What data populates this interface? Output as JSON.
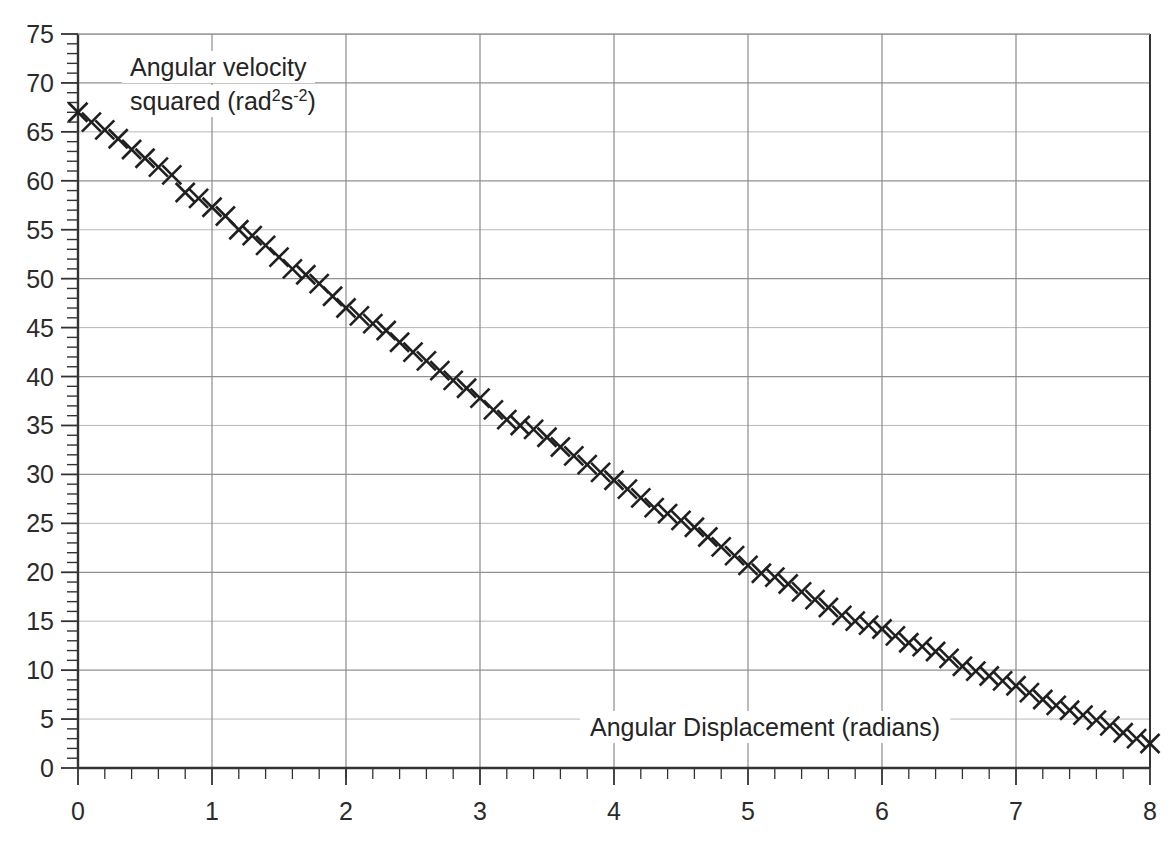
{
  "chart_data": {
    "type": "scatter",
    "title": "",
    "xlabel": "Angular Displacement (radians)",
    "ylabel_line1": "Angular velocity",
    "ylabel_line2_prefix": "squared (rad",
    "ylabel_sup1": "2",
    "ylabel_mid": "s",
    "ylabel_sup2": "-2",
    "ylabel_suffix": ")",
    "ylabel_plain": "Angular velocity squared (rad2s-2)",
    "xlim": [
      0,
      8
    ],
    "ylim": [
      0,
      75
    ],
    "x_major_step": 1,
    "x_minor_step": 0.2,
    "y_major_step": 5,
    "y_minor_step": 1,
    "grid": true,
    "legend": "none",
    "marker": "x-cross",
    "marker_color": "#1f1f1f",
    "grid_color": "#8c8c8c",
    "axis_color": "#333333",
    "xticks": [
      "0",
      "1",
      "2",
      "3",
      "4",
      "5",
      "6",
      "7",
      "8"
    ],
    "xtick_values": [
      0,
      1,
      2,
      3,
      4,
      5,
      6,
      7,
      8
    ],
    "yticks": [
      "0",
      "5",
      "10",
      "15",
      "20",
      "25",
      "30",
      "35",
      "40",
      "45",
      "50",
      "55",
      "60",
      "65",
      "70",
      "75"
    ],
    "ytick_values": [
      0,
      5,
      10,
      15,
      20,
      25,
      30,
      35,
      40,
      45,
      50,
      55,
      60,
      65,
      70,
      75
    ],
    "fit_line": {
      "intercept": 67.0,
      "slope": -8.06
    },
    "x": [
      0.0,
      0.1,
      0.2,
      0.3,
      0.4,
      0.5,
      0.6,
      0.7,
      0.8,
      0.9,
      1.0,
      1.1,
      1.2,
      1.3,
      1.4,
      1.5,
      1.6,
      1.7,
      1.8,
      1.9,
      2.0,
      2.1,
      2.2,
      2.3,
      2.4,
      2.5,
      2.6,
      2.7,
      2.8,
      2.9,
      3.0,
      3.1,
      3.2,
      3.3,
      3.4,
      3.5,
      3.6,
      3.7,
      3.8,
      3.9,
      4.0,
      4.1,
      4.2,
      4.3,
      4.4,
      4.5,
      4.6,
      4.7,
      4.8,
      4.9,
      5.0,
      5.1,
      5.2,
      5.3,
      5.4,
      5.5,
      5.6,
      5.7,
      5.8,
      5.9,
      6.0,
      6.1,
      6.2,
      6.3,
      6.4,
      6.5,
      6.6,
      6.7,
      6.8,
      6.9,
      7.0,
      7.1,
      7.2,
      7.3,
      7.4,
      7.5,
      7.6,
      7.7,
      7.8,
      7.9,
      8.0
    ],
    "y": [
      67.0,
      66.0,
      65.2,
      64.3,
      63.2,
      62.3,
      61.4,
      60.6,
      58.8,
      58.2,
      57.3,
      56.4,
      55.0,
      54.4,
      53.4,
      52.2,
      51.0,
      50.4,
      49.5,
      48.2,
      47.0,
      46.2,
      45.4,
      44.7,
      43.5,
      42.5,
      41.6,
      40.6,
      39.6,
      38.8,
      37.8,
      36.6,
      35.6,
      35.0,
      34.6,
      33.8,
      32.8,
      31.9,
      31.0,
      30.2,
      29.4,
      28.5,
      27.6,
      26.6,
      26.0,
      25.3,
      24.6,
      23.6,
      22.6,
      21.7,
      20.7,
      19.9,
      19.5,
      18.8,
      18.0,
      17.2,
      16.4,
      15.6,
      15.0,
      14.6,
      14.2,
      13.5,
      12.8,
      12.4,
      11.9,
      11.2,
      10.4,
      9.9,
      9.4,
      8.9,
      8.4,
      7.7,
      7.0,
      6.4,
      5.9,
      5.4,
      4.9,
      4.3,
      3.6,
      3.0,
      2.5
    ],
    "n_points": 81
  },
  "figure": {
    "width": 1173,
    "height": 846,
    "background": "#ffffff"
  }
}
